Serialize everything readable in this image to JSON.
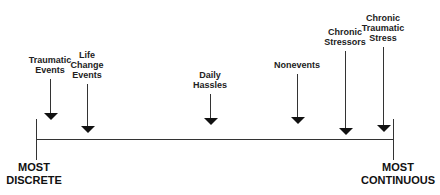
{
  "diagram": {
    "left_end": {
      "line1": "MOST",
      "line2": "DISCRETE"
    },
    "right_end": {
      "line1": "MOST",
      "line2": "CONTINUOUS"
    },
    "events": [
      {
        "lines": [
          "Traumatic",
          "Events"
        ],
        "x": 50,
        "label_top": 55,
        "head_y": 113
      },
      {
        "lines": [
          "Life",
          "Change",
          "Events"
        ],
        "x": 87,
        "label_top": 50,
        "head_y": 126
      },
      {
        "lines": [
          "Daily",
          "Hassles"
        ],
        "x": 210,
        "label_top": 70,
        "head_y": 118
      },
      {
        "lines": [
          "Nonevents"
        ],
        "x": 297,
        "label_top": 60,
        "head_y": 117
      },
      {
        "lines": [
          "Chronic",
          "Stressors"
        ],
        "x": 345,
        "label_top": 27,
        "head_y": 128
      },
      {
        "lines": [
          "Chronic",
          "Traumatic",
          "Stress"
        ],
        "x": 383,
        "label_top": 13,
        "head_y": 125
      }
    ]
  }
}
